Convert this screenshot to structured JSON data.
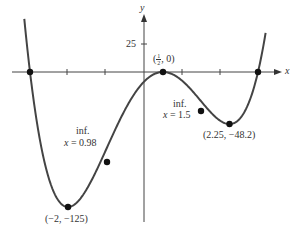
{
  "chart_data": {
    "type": "line",
    "title": "",
    "xlabel": "x",
    "ylabel": "y",
    "function": "f(x) = 4(x+3)(x-1/2)^2(x-3)",
    "x_ticks": [
      -2,
      -1,
      1,
      2
    ],
    "y_ticks": [
      25
    ],
    "y_tick_labels": [
      "25"
    ],
    "grid": false,
    "series": [
      {
        "name": "f(x)",
        "x": [
          -3.1,
          -3,
          -2.5,
          -2,
          -1.5,
          -1,
          -0.5,
          0,
          0.5,
          1,
          1.5,
          2,
          2.25,
          2.5,
          3,
          3.15
        ],
        "y": [
          13.2,
          0,
          -82.6,
          -125,
          -117,
          -90,
          -50,
          -18,
          0,
          -16,
          -36,
          -45,
          -48.2,
          -44,
          0,
          30
        ]
      }
    ],
    "points": [
      {
        "x": -3,
        "y": 0,
        "label": ""
      },
      {
        "x": -2,
        "y": -125,
        "label": "(−2, −125)"
      },
      {
        "x": -0.98,
        "y": -83.3,
        "label": "inf. x = 0.98"
      },
      {
        "x": 0.5,
        "y": 0,
        "label": "(1/2, 0)"
      },
      {
        "x": 1.5,
        "y": -36,
        "label": "inf. x = 1.5"
      },
      {
        "x": 2.25,
        "y": -48.2,
        "label": "(2.25, −48.2)"
      },
      {
        "x": 3,
        "y": 0,
        "label": ""
      }
    ]
  },
  "labels": {
    "y_axis": "y",
    "x_axis": "x",
    "y_tick_25": "25",
    "point_half_open": "(",
    "point_half_num": "1",
    "point_half_den": "2",
    "point_half_close": ", 0)",
    "inf1_line1": "inf.",
    "inf1_line2_var": "x",
    "inf1_line2_val": " = 0.98",
    "inf2_line1": "inf.",
    "inf2_line2_var": "x",
    "inf2_line2_val": " = 1.5",
    "min_left": "(−2, −125)",
    "min_right": "(2.25, −48.2)"
  }
}
